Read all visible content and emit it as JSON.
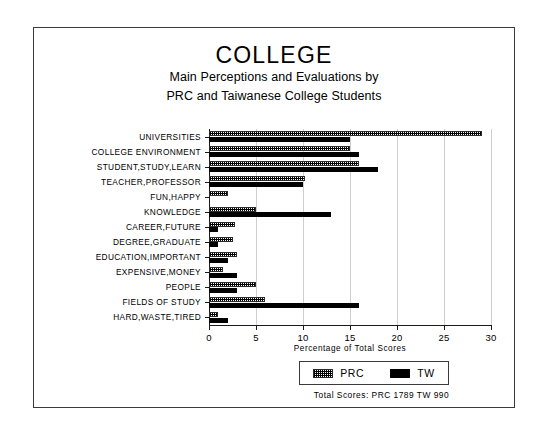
{
  "figure": {
    "title": "COLLEGE",
    "subtitle_line1": "Main Perceptions and Evaluations by",
    "subtitle_line2": "PRC and Taiwanese College Students",
    "totals_text": "Total Scores:  PRC 1789  TW 990"
  },
  "chart_data": {
    "type": "bar",
    "orientation": "horizontal",
    "title": "COLLEGE",
    "subtitle": "Main Perceptions and Evaluations by PRC and Taiwanese College Students",
    "xlabel": "Percentage of Total Scores",
    "ylabel": "",
    "xlim": [
      0,
      30
    ],
    "xticks": [
      0,
      5,
      10,
      15,
      20,
      25,
      30
    ],
    "xtick_labels": [
      "0",
      "5",
      "10",
      "15",
      "20",
      "25",
      "30"
    ],
    "grid": true,
    "legend_position": "bottom-right",
    "categories": [
      "UNIVERSITIES",
      "COLLEGE ENVIRONMENT",
      "STUDENT,STUDY,LEARN",
      "TEACHER,PROFESSOR",
      "FUN,HAPPY",
      "KNOWLEDGE",
      "CAREER,FUTURE",
      "DEGREE,GRADUATE",
      "EDUCATION,IMPORTANT",
      "EXPENSIVE,MONEY",
      "PEOPLE",
      "FIELDS OF STUDY",
      "HARD,WASTE,TIRED"
    ],
    "series": [
      {
        "name": "PRC",
        "pattern": "hatched",
        "color": "#ffffff",
        "values": [
          29.0,
          15.0,
          16.0,
          10.2,
          2.0,
          5.0,
          2.8,
          2.5,
          3.0,
          1.5,
          5.0,
          6.0,
          1.0
        ]
      },
      {
        "name": "TW",
        "pattern": "solid",
        "color": "#000000",
        "values": [
          15.0,
          16.0,
          18.0,
          10.0,
          0.0,
          13.0,
          1.0,
          1.0,
          2.0,
          3.0,
          3.0,
          16.0,
          2.0
        ]
      }
    ],
    "annotations": [
      "Total Scores:  PRC 1789  TW 990"
    ]
  },
  "legend": {
    "entries": [
      {
        "label": "PRC"
      },
      {
        "label": "TW"
      }
    ]
  }
}
